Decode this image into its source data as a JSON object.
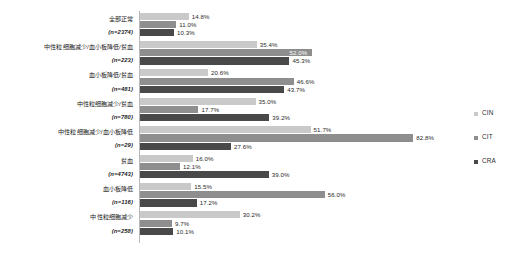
{
  "chart_data": {
    "type": "bar",
    "orientation": "horizontal",
    "title": "",
    "xlabel": "",
    "ylabel": "",
    "xlim": [
      0,
      100
    ],
    "grid": false,
    "legend_position": "right",
    "value_suffix": "%",
    "categories": [
      "全部正常",
      "中性粒细胞减少/血小板降低/贫血",
      "血小板降低/贫血",
      "中性粒细胞减少/贫血",
      "中性粒细胞减少/血小板降低",
      "贫血",
      "血小板降低",
      "中性粒细胞减少"
    ],
    "category_counts": [
      "(n=2374)",
      "(n=223)",
      "(n=481)",
      "(n=780)",
      "(n=29)",
      "(n=4743)",
      "(n=116)",
      "(n=258)"
    ],
    "series": [
      {
        "name": "CIN",
        "color": "#c9c9c9",
        "values": [
          14.8,
          35.4,
          20.6,
          35.0,
          51.7,
          16.0,
          15.5,
          30.2
        ],
        "labels": [
          "14.8%",
          "35.4%",
          "20.6%",
          "35.0%",
          "51.7%",
          "16.0%",
          "15.5%",
          "30.2%"
        ]
      },
      {
        "name": "CIT",
        "color": "#8e8e8e",
        "values": [
          11.0,
          52.0,
          46.6,
          17.7,
          82.8,
          12.1,
          56.0,
          9.7
        ],
        "labels": [
          "11.0%",
          "52.0%",
          "46.6%",
          "17.7%",
          "82.8%",
          "12.1%",
          "56.0%",
          "9.7%"
        ]
      },
      {
        "name": "CRA",
        "color": "#494949",
        "values": [
          10.3,
          45.3,
          43.7,
          39.2,
          27.6,
          39.0,
          17.2,
          10.1
        ],
        "labels": [
          "10.3%",
          "45.3%",
          "43.7%",
          "39.2%",
          "27.6%",
          "39.0%",
          "17.2%",
          "10.1%"
        ]
      }
    ],
    "legend": [
      {
        "label": "CIN",
        "color": "#c9c9c9"
      },
      {
        "label": "CIT",
        "color": "#8e8e8e"
      },
      {
        "label": "CRA",
        "color": "#494949"
      }
    ]
  }
}
